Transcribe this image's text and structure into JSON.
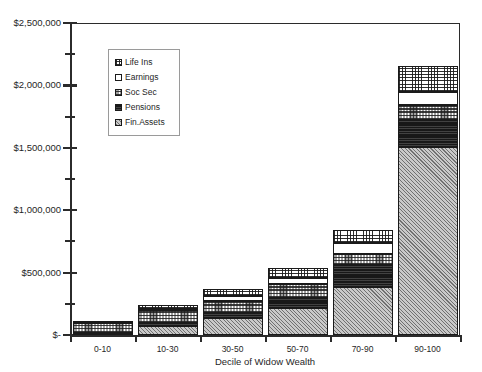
{
  "chart_data": {
    "type": "bar",
    "subtype": "stacked-column",
    "title": "",
    "xlabel": "Decile of Widow Wealth",
    "ylabel": "",
    "categories": [
      "0-10",
      "10-30",
      "30-50",
      "50-70",
      "70-90",
      "90-100"
    ],
    "ylim": [
      0,
      2500000
    ],
    "ytick_values": [
      0,
      500000,
      1000000,
      1500000,
      2000000,
      2500000
    ],
    "ytick_labels": [
      "$-",
      "$500,000",
      "$1,000,000",
      "$1,500,000",
      "$2,000,000",
      "$2,500,000"
    ],
    "yminor_tick_values": [
      250000,
      750000,
      1250000,
      1750000,
      2250000
    ],
    "grid": false,
    "legend_position": "inside-upper-left",
    "stack_order_bottom_to_top": [
      "Fin.Assets",
      "Pensions",
      "Soc Sec",
      "Earnings",
      "Life Ins"
    ],
    "series": [
      {
        "name": "Fin.Assets",
        "values": [
          10000,
          75000,
          140000,
          215000,
          385000,
          1510000
        ]
      },
      {
        "name": "Pensions",
        "values": [
          5000,
          20000,
          35000,
          85000,
          175000,
          215000
        ]
      },
      {
        "name": "Soc Sec",
        "values": [
          85000,
          105000,
          95000,
          105000,
          90000,
          120000
        ]
      },
      {
        "name": "Earnings",
        "values": [
          5000,
          10000,
          45000,
          55000,
          90000,
          105000
        ]
      },
      {
        "name": "Life Ins",
        "values": [
          5000,
          30000,
          50000,
          80000,
          100000,
          205000
        ]
      }
    ],
    "totals": [
      110000,
      240000,
      365000,
      540000,
      840000,
      2155000
    ]
  },
  "legend": {
    "items": [
      {
        "label": "Life Ins",
        "swatch": "crosshatch-grid-pattern"
      },
      {
        "label": "Earnings",
        "swatch": "white-solid-pattern"
      },
      {
        "label": "Soc Sec",
        "swatch": "coarse-dot-pattern"
      },
      {
        "label": "Pensions",
        "swatch": "dark-solid-pattern"
      },
      {
        "label": "Fin.Assets",
        "swatch": "diagonal-hatch-pattern"
      }
    ]
  },
  "axes": {
    "x_title": "Decile of Widow Wealth"
  }
}
